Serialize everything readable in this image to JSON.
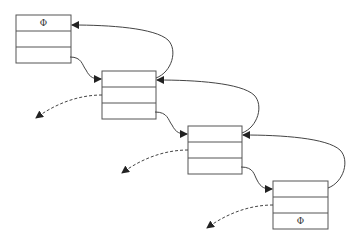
{
  "diagram": {
    "type": "doubly-linked-list",
    "nodes": [
      {
        "id": "node1",
        "fields": [
          "Φ",
          "",
          ""
        ]
      },
      {
        "id": "node2",
        "fields": [
          "",
          "",
          ""
        ]
      },
      {
        "id": "node3",
        "fields": [
          "",
          "",
          ""
        ]
      },
      {
        "id": "node4",
        "fields": [
          "",
          "",
          "Φ"
        ]
      }
    ],
    "edges": [
      {
        "from": "node1.field3",
        "to": "node2.field1",
        "style": "solid"
      },
      {
        "from": "node2.field1",
        "to": "node1.field1",
        "style": "solid"
      },
      {
        "from": "node2.field3",
        "to": "node3.field1",
        "style": "solid"
      },
      {
        "from": "node3.field1",
        "to": "node2.field1",
        "style": "solid"
      },
      {
        "from": "node3.field3",
        "to": "node4.field1",
        "style": "solid"
      },
      {
        "from": "node4.field1",
        "to": "node3.field1",
        "style": "solid"
      },
      {
        "from": "node2.field2",
        "to": "outside",
        "style": "dashed"
      },
      {
        "from": "node3.field2",
        "to": "outside",
        "style": "dashed"
      },
      {
        "from": "node4.field2",
        "to": "outside",
        "style": "dashed"
      }
    ]
  }
}
